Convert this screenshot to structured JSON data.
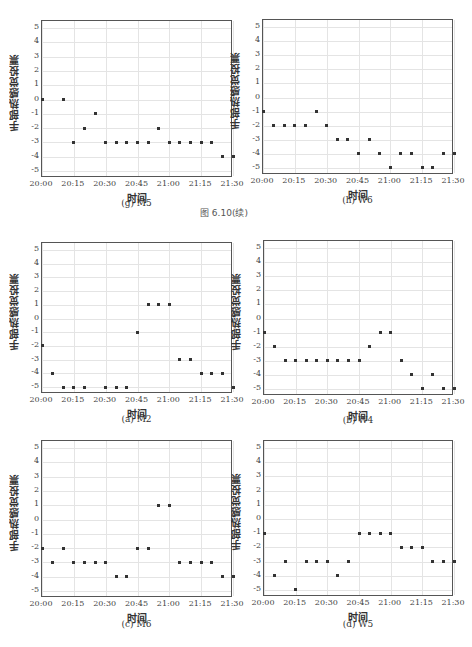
{
  "figure_caption": "图 6.10(续)",
  "chart_data": [
    {
      "type": "scatter",
      "id": "g",
      "title": "(g) M5",
      "xlabel": "时间",
      "ylabel": "手部热感觉投票",
      "xticks": [
        "20:00",
        "20:15",
        "20:30",
        "20:45",
        "21:00",
        "21:15",
        "21:30"
      ],
      "yticks": [
        5,
        4,
        3,
        2,
        1,
        0,
        -1,
        -2,
        -3,
        -4,
        -5
      ],
      "ylim": [
        -5.5,
        5.5
      ],
      "grid": true,
      "x": [
        "20:00",
        "20:10",
        "20:15",
        "20:20",
        "20:25",
        "20:30",
        "20:35",
        "20:40",
        "20:45",
        "20:50",
        "20:55",
        "21:00",
        "21:05",
        "21:10",
        "21:15",
        "21:20",
        "21:25",
        "21:30"
      ],
      "y": [
        0,
        0,
        -3,
        -2,
        -1,
        -3,
        -3,
        -3,
        -3,
        -3,
        -2,
        -3,
        -3,
        -3,
        -3,
        -3,
        -4,
        -4
      ]
    },
    {
      "type": "scatter",
      "id": "h",
      "title": "(h) W6",
      "xlabel": "时间",
      "ylabel": "手部热感觉投票",
      "xticks": [
        "20:00",
        "20:15",
        "20:30",
        "20:45",
        "21:00",
        "21:15",
        "21:30"
      ],
      "yticks": [
        5,
        4,
        3,
        2,
        1,
        0,
        -1,
        -2,
        -3,
        -4,
        -5
      ],
      "ylim": [
        -5.5,
        5.5
      ],
      "grid": true,
      "x": [
        "20:00",
        "20:05",
        "20:10",
        "20:15",
        "20:20",
        "20:25",
        "20:30",
        "20:35",
        "20:40",
        "20:45",
        "20:50",
        "20:55",
        "21:00",
        "21:05",
        "21:10",
        "21:15",
        "21:20",
        "21:25",
        "21:30"
      ],
      "y": [
        -1,
        -2,
        -2,
        -2,
        -2,
        -1,
        -2,
        -3,
        -3,
        -4,
        -3,
        -4,
        -5,
        -4,
        -4,
        -5,
        -5,
        -4,
        -4
      ]
    },
    {
      "type": "scatter",
      "id": "a",
      "title": "(a) M2",
      "xlabel": "时间",
      "ylabel": "手部热感觉投票",
      "xticks": [
        "20:00",
        "20:15",
        "20:30",
        "20:45",
        "21:00",
        "21:15",
        "21:30"
      ],
      "yticks": [
        5,
        4,
        3,
        2,
        1,
        0,
        -1,
        -2,
        -3,
        -4,
        -5
      ],
      "ylim": [
        -5.5,
        5.5
      ],
      "grid": true,
      "x": [
        "20:00",
        "20:05",
        "20:10",
        "20:15",
        "20:20",
        "20:30",
        "20:35",
        "20:40",
        "20:45",
        "20:50",
        "20:55",
        "21:00",
        "21:05",
        "21:10",
        "21:15",
        "21:20",
        "21:25",
        "21:30"
      ],
      "y": [
        -2,
        -4,
        -5,
        -5,
        -5,
        -5,
        -5,
        -5,
        -1,
        1,
        1,
        1,
        -3,
        -3,
        -4,
        -4,
        -4,
        -5
      ]
    },
    {
      "type": "scatter",
      "id": "b",
      "title": "(b) W4",
      "xlabel": "时间",
      "ylabel": "手部热感觉投票",
      "xticks": [
        "20:00",
        "20:15",
        "20:30",
        "20:45",
        "21:00",
        "21:15",
        "21:30"
      ],
      "yticks": [
        5,
        4,
        3,
        2,
        1,
        0,
        -1,
        -2,
        -3,
        -4,
        -5
      ],
      "ylim": [
        -5.5,
        5.5
      ],
      "grid": true,
      "x": [
        "20:00",
        "20:05",
        "20:10",
        "20:15",
        "20:20",
        "20:25",
        "20:30",
        "20:35",
        "20:40",
        "20:45",
        "20:50",
        "20:55",
        "21:00",
        "21:05",
        "21:10",
        "21:15",
        "21:20",
        "21:25",
        "21:30"
      ],
      "y": [
        -1,
        -2,
        -3,
        -3,
        -3,
        -3,
        -3,
        -3,
        -3,
        -3,
        -2,
        -1,
        -1,
        -3,
        -4,
        -5,
        -4,
        -5,
        -5
      ]
    },
    {
      "type": "scatter",
      "id": "c",
      "title": "(c) M6",
      "xlabel": "时间",
      "ylabel": "手部热感觉投票",
      "xticks": [
        "20:00",
        "20:15",
        "20:30",
        "20:45",
        "21:00",
        "21:15",
        "21:30"
      ],
      "yticks": [
        5,
        4,
        3,
        2,
        1,
        0,
        -1,
        -2,
        -3,
        -4,
        -5
      ],
      "ylim": [
        -5.5,
        5.5
      ],
      "grid": true,
      "x": [
        "20:00",
        "20:05",
        "20:10",
        "20:15",
        "20:20",
        "20:25",
        "20:30",
        "20:35",
        "20:40",
        "20:45",
        "20:50",
        "20:55",
        "21:00",
        "21:05",
        "21:10",
        "21:15",
        "21:20",
        "21:25",
        "21:30"
      ],
      "y": [
        -2,
        -3,
        -2,
        -3,
        -3,
        -3,
        -3,
        -4,
        -4,
        -2,
        -2,
        1,
        1,
        -3,
        -3,
        -3,
        -3,
        -4,
        -4
      ]
    },
    {
      "type": "scatter",
      "id": "d",
      "title": "(d) W5",
      "xlabel": "时间",
      "ylabel": "手部热感觉投票",
      "xticks": [
        "20:00",
        "20:15",
        "20:30",
        "20:45",
        "21:00",
        "21:15",
        "21:30"
      ],
      "yticks": [
        5,
        4,
        3,
        2,
        1,
        0,
        -1,
        -2,
        -3,
        -4,
        -5
      ],
      "ylim": [
        -5.5,
        5.5
      ],
      "grid": true,
      "x": [
        "20:00",
        "20:05",
        "20:10",
        "20:15",
        "20:20",
        "20:25",
        "20:30",
        "20:35",
        "20:40",
        "20:45",
        "20:50",
        "20:55",
        "21:00",
        "21:05",
        "21:10",
        "21:15",
        "21:20",
        "21:25",
        "21:30"
      ],
      "y": [
        -1,
        -4,
        -3,
        -5,
        -3,
        -3,
        -3,
        -4,
        -3,
        -1,
        -1,
        -1,
        -1,
        -2,
        -2,
        -2,
        -3,
        -3,
        -3
      ]
    }
  ],
  "layout": [
    {
      "left": 41,
      "top": 20,
      "width": 191,
      "height": 157,
      "caption_y": 204
    },
    {
      "left": 262,
      "top": 19,
      "width": 191,
      "height": 155,
      "caption_y": 201
    },
    {
      "left": 41,
      "top": 242,
      "width": 191,
      "height": 151,
      "caption_y": 420
    },
    {
      "left": 263,
      "top": 240,
      "width": 190,
      "height": 155,
      "caption_y": 421
    },
    {
      "left": 41,
      "top": 440,
      "width": 191,
      "height": 157,
      "caption_y": 625
    },
    {
      "left": 263,
      "top": 440,
      "width": 190,
      "height": 156,
      "caption_y": 625
    }
  ],
  "colors": {
    "points": "#333333",
    "frame": "#555555",
    "grid": "#e4e4e4"
  }
}
